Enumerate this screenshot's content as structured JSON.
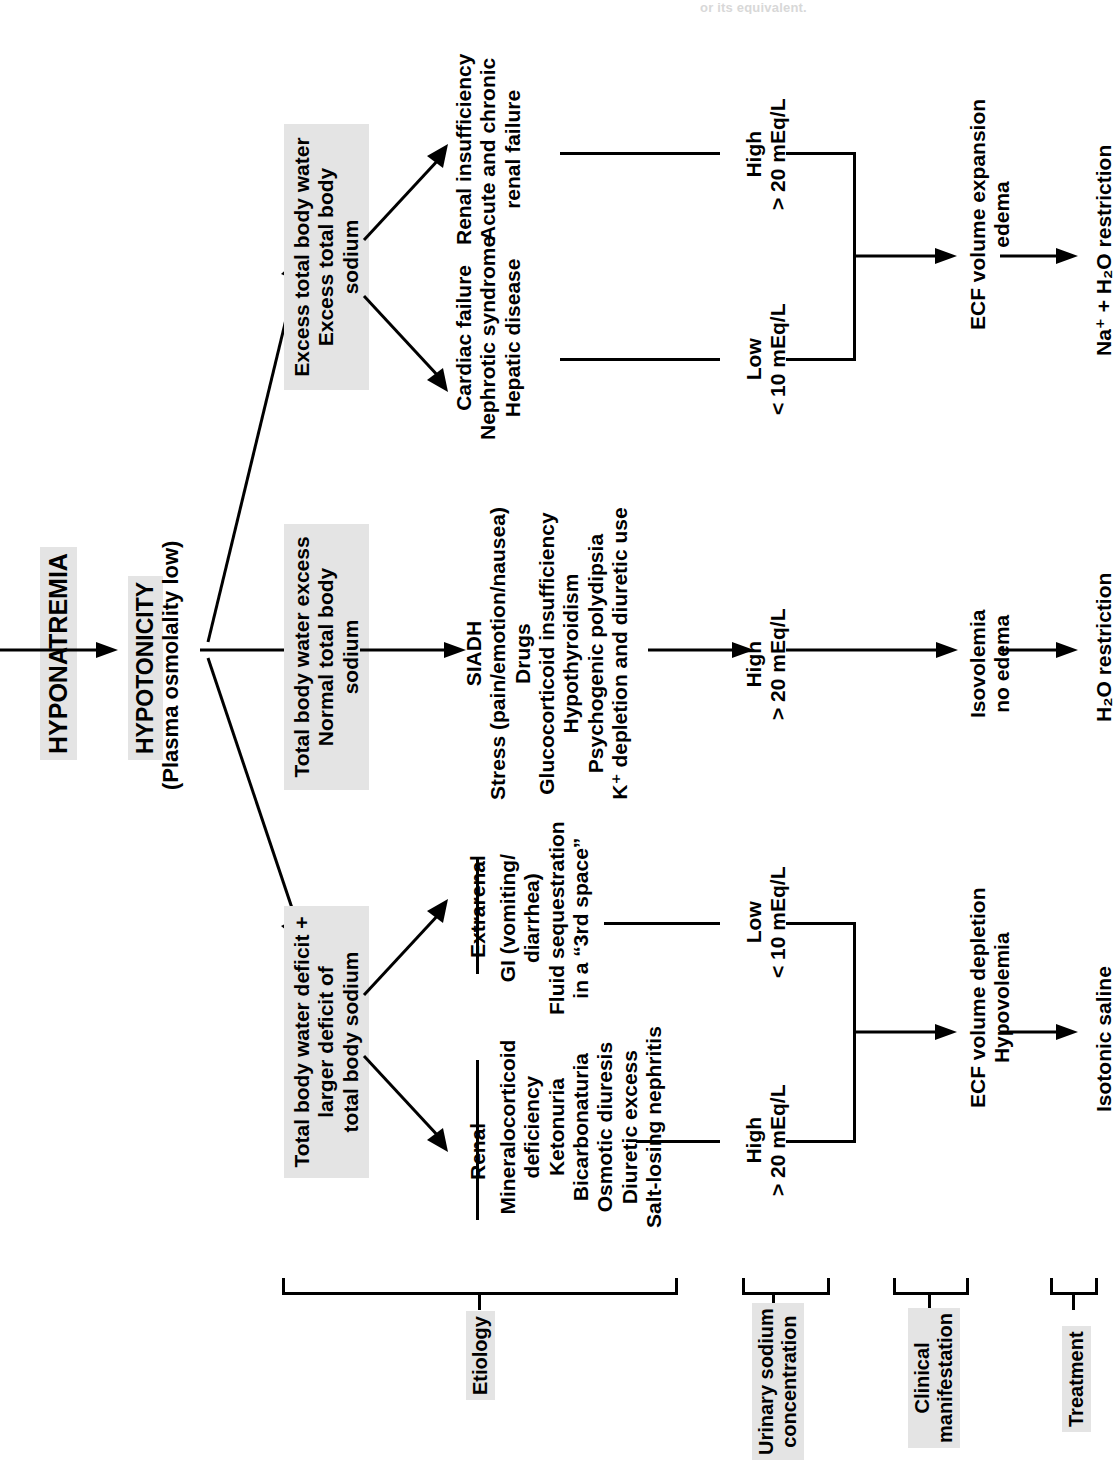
{
  "diagram": {
    "orientation": "rotated-90-ccw",
    "colors": {
      "shade": "#e4e4e4",
      "line": "#000000",
      "background": "#ffffff"
    },
    "top_cut_text": "or its equivalent."
  },
  "root": {
    "label": "HYPONATREMIA"
  },
  "tonicity": {
    "label": "HYPOTONICITY",
    "sub": "(Plasma osmolality low)"
  },
  "branches": [
    {
      "id": "hypervolemic",
      "state": "Excess total body water\nExcess total body sodium",
      "state_lines": [
        "Excess total body water",
        "Excess total body",
        "sodium"
      ],
      "etiology_groups": [
        {
          "title": "",
          "items": [
            "Renal insufficiency",
            "Acute and chronic",
            "renal failure"
          ]
        },
        {
          "title": "",
          "items": [
            "Cardiac failure",
            "Nephrotic syndrome",
            "Hepatic disease"
          ]
        }
      ],
      "urine_sodium": [
        {
          "level": "High",
          "value": "> 20 mEq/L"
        },
        {
          "level": "Low",
          "value": "< 10 mEq/L"
        }
      ],
      "clinical": [
        "ECF volume expansion",
        "edema"
      ],
      "treatment": [
        "Na⁺ + H₂O restriction"
      ]
    },
    {
      "id": "euvolemic",
      "state_lines": [
        "Total body water excess",
        "Normal total body",
        "sodium"
      ],
      "etiology_groups": [
        {
          "title": "",
          "items": [
            "SIADH",
            "Stress (pain/emotion/nausea)",
            "Drugs",
            "Glucocorticoid insufficiency",
            "Hypothyroidism",
            "Psychogenic polydipsia",
            "K⁺ depletion and diuretic use"
          ]
        }
      ],
      "urine_sodium": [
        {
          "level": "High",
          "value": "> 20 mEq/L"
        }
      ],
      "clinical": [
        "Isovolemia",
        "no edema"
      ],
      "treatment": [
        "H₂O restriction"
      ]
    },
    {
      "id": "hypovolemic",
      "state_lines": [
        "Total body water deficit +",
        "larger deficit of",
        "total body sodium"
      ],
      "etiology_groups": [
        {
          "title": "Extrarenal",
          "items": [
            "GI (vomiting/",
            "diarrhea)",
            "Fluid sequestration",
            "in a “3rd space”"
          ]
        },
        {
          "title": "Renal",
          "items": [
            "Mineralocorticoid",
            "deficiency",
            "Ketonuria",
            "Bicarbonaturia",
            "Osmotic diuresis",
            "Diuretic excess",
            "Salt-losing nephritis"
          ]
        }
      ],
      "urine_sodium": [
        {
          "level": "Low",
          "value": "< 10 mEq/L"
        },
        {
          "level": "High",
          "value": "> 20 mEq/L"
        }
      ],
      "clinical": [
        "ECF volume depletion",
        "Hypovolemia"
      ],
      "treatment": [
        "Isotonic saline"
      ]
    }
  ],
  "column_labels": [
    {
      "id": "etiology",
      "lines": [
        "Etiology"
      ]
    },
    {
      "id": "urinary-sodium-concentration",
      "lines": [
        "Urinary sodium",
        "concentration"
      ]
    },
    {
      "id": "clinical-manifestation",
      "lines": [
        "Clinical",
        "manifestation"
      ]
    },
    {
      "id": "treatment",
      "lines": [
        "Treatment"
      ]
    }
  ]
}
